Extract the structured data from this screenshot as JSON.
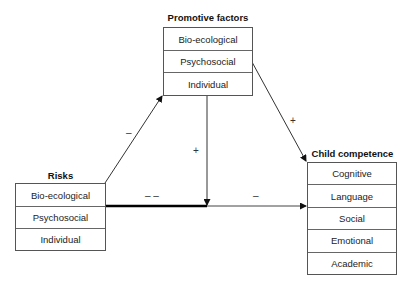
{
  "promotive": {
    "title": "Promotive factors",
    "rows": [
      "Bio-ecological",
      "Psychosocial",
      "Individual"
    ]
  },
  "risks": {
    "title": "Risks",
    "rows": [
      "Bio-ecological",
      "Psychosocial",
      "Individual"
    ]
  },
  "competence": {
    "title": "Child competence",
    "rows": [
      "Cognitive",
      "Language",
      "Social",
      "Emotional",
      "Academic"
    ]
  },
  "signs": {
    "risks_to_promotive": "–",
    "promotive_to_path": "+",
    "promotive_to_competence": "+",
    "risks_direct_strong": "– –",
    "path_to_competence": "–"
  }
}
